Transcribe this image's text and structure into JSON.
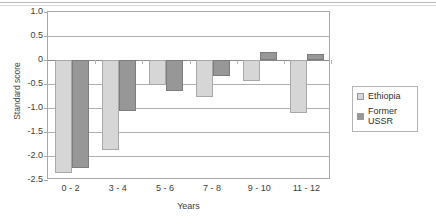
{
  "chart_data": {
    "type": "bar",
    "title": "",
    "xlabel": "Years",
    "ylabel": "Standard score",
    "categories": [
      "0 - 2",
      "3 - 4",
      "5 - 6",
      "7 - 8",
      "9 - 10",
      "11 - 12"
    ],
    "series": [
      {
        "name": "Ethiopia",
        "color": "#d6d6d6",
        "values": [
          -2.35,
          -1.88,
          -0.52,
          -0.78,
          -0.43,
          -1.1
        ]
      },
      {
        "name": "Former USSR",
        "color": "#979797",
        "values": [
          -2.25,
          -1.06,
          -0.65,
          -0.33,
          0.16,
          0.13
        ]
      }
    ],
    "ylim": [
      -2.5,
      1.0
    ],
    "ytick_values": [
      1.0,
      0.5,
      0,
      -0.5,
      -1.0,
      -1.5,
      -2.0,
      -2.5
    ],
    "ytick_labels": [
      "1.0",
      "0.5",
      "0",
      "-0.5",
      "-1.0",
      "-1.5",
      "-2.0",
      "-2.5"
    ],
    "grid": true,
    "legend_position": "right",
    "legend_entries": [
      "Ethiopia",
      "Former USSR"
    ]
  }
}
